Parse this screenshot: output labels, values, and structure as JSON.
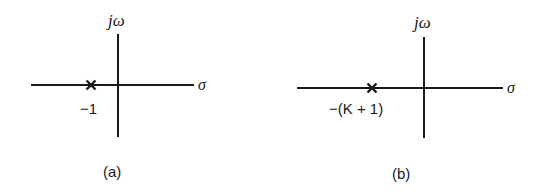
{
  "diagrams": [
    {
      "id": "a",
      "caption": "(a)",
      "vertical_axis_label": "jω",
      "horizontal_axis_label": "σ",
      "pole_marker": "×",
      "pole_label": "−1"
    },
    {
      "id": "b",
      "caption": "(b)",
      "vertical_axis_label": "jω",
      "horizontal_axis_label": "σ",
      "pole_marker": "×",
      "pole_label": "−(K + 1)"
    }
  ],
  "colors": {
    "ink": "#1a1a1a",
    "background": "#ffffff"
  }
}
